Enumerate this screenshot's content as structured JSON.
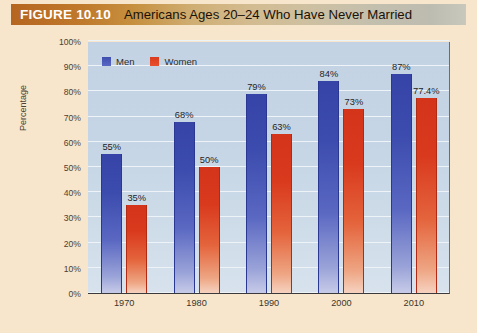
{
  "figure": {
    "number": "FIGURE 10.10",
    "title": "Americans Ages 20–24 Who Have Never Married"
  },
  "chart_data": {
    "type": "bar",
    "title": "Americans Ages 20–24 Who Have Never Married",
    "xlabel": "",
    "ylabel": "Percentage",
    "categories": [
      "1970",
      "1980",
      "1990",
      "2000",
      "2010"
    ],
    "series": [
      {
        "name": "Men",
        "color": "#3c4cae",
        "values": [
          55,
          68,
          79,
          84,
          87
        ],
        "labels": [
          "55%",
          "68%",
          "79%",
          "84%",
          "87%"
        ]
      },
      {
        "name": "Women",
        "color": "#d93a1e",
        "values": [
          35,
          50,
          63,
          73,
          77.4
        ],
        "labels": [
          "35%",
          "50%",
          "63%",
          "73%",
          "77.4%"
        ]
      }
    ],
    "ylim": [
      0,
      100
    ],
    "ytick_values": [
      0,
      10,
      20,
      30,
      40,
      50,
      60,
      70,
      80,
      90,
      100
    ],
    "ytick_labels": [
      "0%",
      "10%",
      "20%",
      "30%",
      "40%",
      "50%",
      "60%",
      "70%",
      "80%",
      "90%",
      "100%"
    ],
    "grid": true,
    "legend_position": "top-left",
    "legend_entries": [
      "Men",
      "Women"
    ]
  },
  "colors": {
    "page_background": "#f7e6cb",
    "plot_background": "#c6d6e6",
    "men_bar": "#3c4cae",
    "women_bar": "#d93a1e",
    "gridline": "#eef3f8",
    "banner_left": "#b5651f",
    "banner_right": "#c9c8bd"
  }
}
